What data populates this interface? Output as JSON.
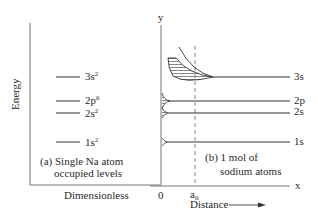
{
  "diagram": {
    "y_axis_label": "Energy",
    "left_panel": {
      "levels": [
        {
          "name": "3s",
          "sup": "2"
        },
        {
          "name": "2p",
          "sup": "6"
        },
        {
          "name": "2s",
          "sup": "2"
        },
        {
          "name": "1s",
          "sup": "2"
        }
      ],
      "caption_line1": "(a) Single Na atom",
      "caption_line2": "occupied levels",
      "x_label": "Dimensionless"
    },
    "right_panel": {
      "axis_y": "y",
      "axis_x": "x",
      "origin": "0",
      "a0_base": "a",
      "a0_sub": "0",
      "levels": [
        "3s",
        "2p",
        "2s",
        "1s"
      ],
      "caption_line1": "(b) 1 mol of",
      "caption_line2": "sodium atoms",
      "x_label": "Distance",
      "arrow": "→"
    }
  }
}
